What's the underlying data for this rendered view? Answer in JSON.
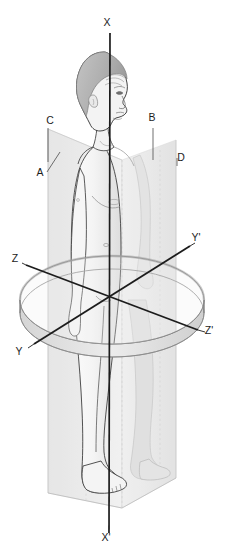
{
  "figure": {
    "background_color": "#ffffff",
    "line_color": "#1c1c1c"
  },
  "axes": [
    {
      "id": "x-superior",
      "label": "X",
      "name": "vertical-axis-superior",
      "x": 107,
      "y": 26,
      "description": "superior end of the vertical (longitudinal) axis"
    },
    {
      "id": "x-inferior",
      "label": "X'",
      "name": "vertical-axis-inferior",
      "x": 106,
      "y": 541,
      "description": "inferior end of the vertical (longitudinal) axis"
    },
    {
      "id": "y-left",
      "label": "Y",
      "name": "oblique-axis-anterior",
      "x": 19,
      "y": 355,
      "description": "anterior-left end of the Y-Y' transverse axis"
    },
    {
      "id": "y-right",
      "label": "Y'",
      "name": "oblique-axis-posterior",
      "x": 194,
      "y": 241,
      "description": "posterior-right end of the Y-Y' transverse axis"
    },
    {
      "id": "z-left",
      "label": "Z",
      "name": "transverse-axis-left",
      "x": 14,
      "y": 262,
      "description": "left end of the Z-Z' transverse axis"
    },
    {
      "id": "z-right",
      "label": "Z'",
      "name": "transverse-axis-right",
      "x": 207,
      "y": 334,
      "description": "right end of the Z-Z' transverse axis"
    }
  ],
  "plane_labels": [
    {
      "id": "a",
      "label": "A",
      "name": "plane-label-a",
      "x": 39,
      "y": 176,
      "description": "anterior-left corner of the coronal plane"
    },
    {
      "id": "b",
      "label": "B",
      "name": "plane-label-b",
      "x": 150,
      "y": 121,
      "description": "superior-right edge of the sagittal plane"
    },
    {
      "id": "c",
      "label": "C",
      "name": "plane-label-c",
      "x": 49,
      "y": 124,
      "description": "superior-left edge of the coronal plane"
    },
    {
      "id": "d",
      "label": "D",
      "name": "plane-label-d",
      "x": 179,
      "y": 161,
      "description": "posterior-right corner of the sagittal plane"
    }
  ],
  "planes": [
    {
      "id": "coronal",
      "name": "coronal-plane",
      "fill": "#e8e8e8",
      "label_refs": [
        "A",
        "C"
      ]
    },
    {
      "id": "sagittal",
      "name": "sagittal-plane",
      "fill": "#ededed",
      "label_refs": [
        "B",
        "D"
      ]
    },
    {
      "id": "transverse",
      "name": "transverse-plane-ring",
      "fill": "#e2e2e2",
      "label_refs": [
        "Y",
        "Y'",
        "Z",
        "Z'"
      ]
    }
  ],
  "body": {
    "name": "human-figure",
    "skin_fill": "#f2f2f2",
    "hair_fill": "#b9b9b9",
    "outline": "#3a3a3a"
  }
}
